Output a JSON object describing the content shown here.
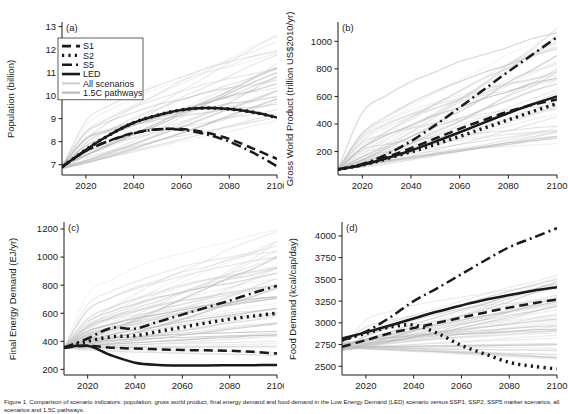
{
  "figure": {
    "caption": "Figure 1. Comparison of scenario indicators: population, gross world product, final energy demand and food demand in the Low Energy Demand (LED) scenario versus SSP1, SSP2, SSP5 marker scenarios, all scenarios and 1.5C pathways.",
    "background": "#ffffff",
    "line_color": "#1a1a1a",
    "all_scenarios_color": "#cfcfcf",
    "pathways_color": "#bdbdbd"
  },
  "legend": {
    "items": [
      {
        "label": "S1",
        "style": "dashed",
        "color": "#1a1a1a"
      },
      {
        "label": "S2",
        "style": "dotted",
        "color": "#1a1a1a"
      },
      {
        "label": "S5",
        "style": "dashdot",
        "color": "#1a1a1a"
      },
      {
        "label": "LED",
        "style": "solid",
        "color": "#1a1a1a"
      },
      {
        "label": "All scenarios",
        "style": "solid-light",
        "color": "#d2d2d2"
      },
      {
        "label": "1.5C pathways",
        "style": "solid-light",
        "color": "#bcbcbc"
      }
    ]
  },
  "chart_data": [
    {
      "id": "panel-a",
      "type": "line",
      "panel_label": "(a)",
      "title": "",
      "xlabel": "",
      "ylabel": "Population (billion)",
      "xlim": [
        2010,
        2100
      ],
      "ylim": [
        6.55,
        13.2
      ],
      "yticks": [
        7,
        8,
        9,
        10,
        11,
        12,
        13
      ],
      "xticks": [
        2020,
        2040,
        2060,
        2080,
        2100
      ],
      "grid": false,
      "legend_position": "upper-left",
      "x": [
        2010,
        2020,
        2030,
        2040,
        2050,
        2060,
        2070,
        2080,
        2090,
        2100
      ],
      "series": [
        {
          "name": "S1",
          "style": "dashed",
          "values": [
            6.9,
            7.6,
            8.05,
            8.38,
            8.54,
            8.55,
            8.4,
            8.12,
            7.7,
            7.25
          ]
        },
        {
          "name": "S2",
          "style": "dotted",
          "values": [
            6.9,
            7.65,
            8.3,
            8.82,
            9.15,
            9.38,
            9.46,
            9.42,
            9.28,
            9.05
          ]
        },
        {
          "name": "S5",
          "style": "dashdot",
          "values": [
            6.9,
            7.6,
            8.04,
            8.36,
            8.53,
            8.52,
            8.33,
            8.0,
            7.52,
            6.93
          ]
        },
        {
          "name": "LED",
          "style": "solid",
          "values": [
            6.9,
            7.65,
            8.3,
            8.82,
            9.15,
            9.38,
            9.46,
            9.42,
            9.28,
            9.05
          ]
        }
      ],
      "envelopes": {
        "all_scenarios": {
          "name": "All scenarios",
          "n_lines": 22,
          "low_2100": 8.9,
          "high_2100": 12.7
        },
        "pathways": {
          "name": "1.5C pathways",
          "n_lines": 10,
          "low_2100": 9.2,
          "high_2100": 11.2
        }
      }
    },
    {
      "id": "panel-b",
      "type": "line",
      "panel_label": "(b)",
      "title": "",
      "xlabel": "",
      "ylabel": "Gross World Product (trillion US$2010/yr)",
      "xlim": [
        2010,
        2100
      ],
      "ylim": [
        30,
        1140
      ],
      "yticks": [
        200,
        400,
        600,
        800,
        1000
      ],
      "xticks": [
        2020,
        2040,
        2060,
        2080,
        2100
      ],
      "grid": false,
      "legend_position": "none",
      "x": [
        2010,
        2020,
        2030,
        2040,
        2050,
        2060,
        2070,
        2080,
        2090,
        2100
      ],
      "series": [
        {
          "name": "S1",
          "style": "dashed",
          "values": [
            70,
            105,
            160,
            225,
            295,
            365,
            430,
            490,
            540,
            578
          ]
        },
        {
          "name": "S2",
          "style": "dotted",
          "values": [
            70,
            102,
            148,
            198,
            252,
            310,
            370,
            430,
            490,
            548
          ]
        },
        {
          "name": "S5",
          "style": "dashdot",
          "values": [
            70,
            110,
            180,
            275,
            392,
            520,
            650,
            780,
            905,
            1030
          ]
        },
        {
          "name": "LED",
          "style": "solid",
          "values": [
            70,
            103,
            152,
            208,
            272,
            340,
            410,
            480,
            543,
            600
          ]
        }
      ],
      "envelopes": {
        "all_scenarios": {
          "name": "All scenarios",
          "n_lines": 34,
          "low_2100": 230,
          "high_2100": 1100
        },
        "pathways": {
          "name": "1.5C pathways",
          "n_lines": 12,
          "low_2100": 300,
          "high_2100": 1070
        }
      }
    },
    {
      "id": "panel-c",
      "type": "line",
      "panel_label": "(c)",
      "title": "",
      "xlabel": "",
      "ylabel": "Final Energy Demand (EJ/yr)",
      "xlim": [
        2010,
        2100
      ],
      "ylim": [
        160,
        1250
      ],
      "yticks": [
        200,
        400,
        600,
        800,
        1000,
        1200
      ],
      "xticks": [
        2020,
        2040,
        2060,
        2080,
        2100
      ],
      "grid": false,
      "legend_position": "none",
      "x": [
        2010,
        2020,
        2030,
        2040,
        2050,
        2060,
        2070,
        2080,
        2090,
        2100
      ],
      "series": [
        {
          "name": "S1",
          "style": "dashed",
          "values": [
            355,
            368,
            355,
            348,
            343,
            338,
            336,
            333,
            325,
            313
          ]
        },
        {
          "name": "S2",
          "style": "dotted",
          "values": [
            355,
            400,
            432,
            440,
            470,
            500,
            530,
            558,
            580,
            600
          ]
        },
        {
          "name": "S5",
          "style": "dashdot",
          "values": [
            355,
            420,
            495,
            490,
            540,
            590,
            640,
            690,
            745,
            795
          ]
        },
        {
          "name": "LED",
          "style": "solid",
          "values": [
            355,
            368,
            300,
            248,
            232,
            228,
            228,
            229,
            230,
            232
          ]
        }
      ],
      "envelopes": {
        "all_scenarios": {
          "name": "All scenarios",
          "n_lines": 42,
          "low_2100": 300,
          "high_2100": 1195
        },
        "pathways": {
          "name": "1.5C pathways",
          "n_lines": 14,
          "low_2100": 330,
          "high_2100": 1000
        }
      }
    },
    {
      "id": "panel-d",
      "type": "line",
      "panel_label": "(d)",
      "title": "",
      "xlabel": "",
      "ylabel": "Food Demand (kcal/cap/day)",
      "xlim": [
        2010,
        2100
      ],
      "ylim": [
        2400,
        4160
      ],
      "yticks": [
        2500,
        2750,
        3000,
        3250,
        3500,
        3750,
        4000
      ],
      "xticks": [
        2020,
        2040,
        2060,
        2080,
        2100
      ],
      "grid": false,
      "legend_position": "none",
      "x": [
        2010,
        2020,
        2030,
        2040,
        2050,
        2060,
        2070,
        2080,
        2090,
        2100
      ],
      "series": [
        {
          "name": "S1",
          "style": "dashed",
          "values": [
            2725,
            2800,
            2880,
            2940,
            3000,
            3060,
            3120,
            3175,
            3225,
            3268
          ]
        },
        {
          "name": "S2",
          "style": "dotted",
          "values": [
            2800,
            2880,
            2950,
            2975,
            2880,
            2740,
            2640,
            2545,
            2500,
            2470
          ]
        },
        {
          "name": "S5",
          "style": "dashdot",
          "values": [
            2800,
            2900,
            3060,
            3250,
            3400,
            3560,
            3720,
            3870,
            3980,
            4090
          ]
        },
        {
          "name": "LED",
          "style": "solid",
          "values": [
            2820,
            2890,
            2970,
            3050,
            3130,
            3200,
            3265,
            3320,
            3370,
            3410
          ]
        }
      ],
      "envelopes": {
        "all_scenarios": {
          "name": "All scenarios",
          "n_lines": 40,
          "low_2100": 2560,
          "high_2100": 3540
        },
        "pathways": {
          "name": "1.5C pathways",
          "n_lines": 14,
          "low_2100": 2600,
          "high_2100": 3500
        }
      }
    }
  ]
}
